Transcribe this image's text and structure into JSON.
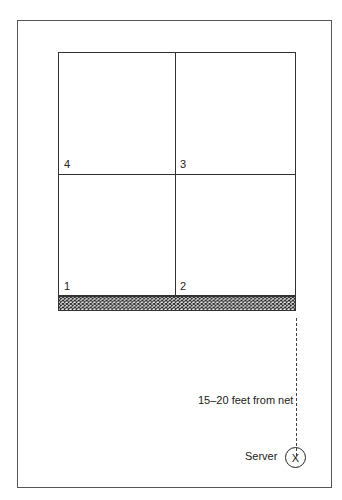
{
  "diagram": {
    "type": "volleyball serving zones",
    "zones": [
      {
        "id": "4",
        "label": "4",
        "position": "top-left"
      },
      {
        "id": "3",
        "label": "3",
        "position": "top-right"
      },
      {
        "id": "1",
        "label": "1",
        "position": "bottom-left"
      },
      {
        "id": "2",
        "label": "2",
        "position": "bottom-right"
      }
    ],
    "net_label": "net",
    "distance_label": "15–20 feet from net",
    "server_label": "Server",
    "server_marker": "X",
    "colors": {
      "line": "#333333",
      "frame": "#555555",
      "background": "#ffffff"
    }
  }
}
